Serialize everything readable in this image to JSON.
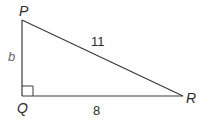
{
  "figure": {
    "type": "right-triangle",
    "vertices": {
      "P": {
        "label": "P",
        "x": 22,
        "y": 20
      },
      "Q": {
        "label": "Q",
        "x": 22,
        "y": 96
      },
      "R": {
        "label": "R",
        "x": 183,
        "y": 96
      }
    },
    "sides": {
      "PQ": {
        "label": "b"
      },
      "PR": {
        "label": "11"
      },
      "QR": {
        "label": "8"
      }
    },
    "right_angle_at": "Q",
    "colors": {
      "stroke": "#3a3a3a",
      "text": "#2b2b2b",
      "variable_text": "#6a6a6a",
      "background": "#ffffff"
    }
  }
}
